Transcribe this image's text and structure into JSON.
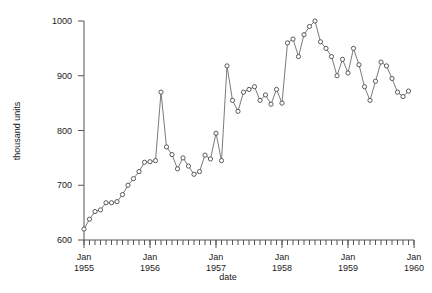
{
  "chart_data": {
    "type": "line",
    "title": "",
    "xlabel": "date",
    "ylabel": "thousand units",
    "ylim": [
      600,
      1000
    ],
    "yticks": [
      600,
      700,
      800,
      900,
      1000
    ],
    "ytick_labels": [
      "600",
      "700",
      "800",
      "900",
      "1000"
    ],
    "xlim": [
      "1955-01",
      "1960-01"
    ],
    "xticks": [
      "1955-01",
      "1956-01",
      "1957-01",
      "1958-01",
      "1959-01",
      "1960-01"
    ],
    "xtick_labels": [
      "Jan\n1955",
      "Jan\n1956",
      "Jan\n1957",
      "Jan\n1958",
      "Jan\n1959",
      "Jan\n1960"
    ],
    "xtick_label_lines": [
      [
        "Jan",
        "1955"
      ],
      [
        "Jan",
        "1956"
      ],
      [
        "Jan",
        "1957"
      ],
      [
        "Jan",
        "1958"
      ],
      [
        "Jan",
        "1959"
      ],
      [
        "Jan",
        "1960"
      ]
    ],
    "minor_ticks": "monthly",
    "grid": false,
    "legend": null,
    "marker": "circle-open",
    "line_color": "#6b6b6b",
    "marker_color": "#4a4a4a",
    "x": [
      "1955-01",
      "1955-02",
      "1955-03",
      "1955-04",
      "1955-05",
      "1955-06",
      "1955-07",
      "1955-08",
      "1955-09",
      "1955-10",
      "1955-11",
      "1955-12",
      "1956-01",
      "1956-02",
      "1956-03",
      "1956-04",
      "1956-05",
      "1956-06",
      "1956-07",
      "1956-08",
      "1956-09",
      "1956-10",
      "1956-11",
      "1956-12",
      "1957-01",
      "1957-02",
      "1957-03",
      "1957-04",
      "1957-05",
      "1957-06",
      "1957-07",
      "1957-08",
      "1957-09",
      "1957-10",
      "1957-11",
      "1957-12",
      "1958-01",
      "1958-02",
      "1958-03",
      "1958-04",
      "1958-05",
      "1958-06",
      "1958-07",
      "1958-08",
      "1958-09",
      "1958-10",
      "1958-11",
      "1958-12",
      "1959-01",
      "1959-02",
      "1959-03",
      "1959-04",
      "1959-05",
      "1959-06",
      "1959-07",
      "1959-08",
      "1959-09",
      "1959-10",
      "1959-11",
      "1959-12"
    ],
    "values": [
      620,
      638,
      652,
      655,
      668,
      668,
      670,
      683,
      700,
      712,
      725,
      742,
      743,
      745,
      870,
      770,
      756,
      730,
      750,
      735,
      720,
      725,
      755,
      748,
      795,
      745,
      918,
      855,
      835,
      870,
      875,
      880,
      855,
      865,
      848,
      875,
      850,
      960,
      967,
      935,
      975,
      990,
      1000,
      962,
      950,
      935,
      900,
      930,
      905,
      950,
      920,
      880,
      855,
      890,
      925,
      918,
      895,
      870,
      862,
      872
    ],
    "value_range": [
      620,
      1000
    ],
    "n_points": 60
  }
}
